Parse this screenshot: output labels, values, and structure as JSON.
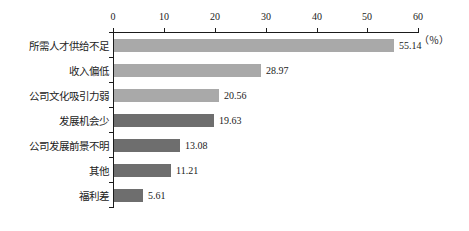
{
  "chart_data": {
    "type": "bar",
    "orientation": "horizontal",
    "title": "",
    "subtitle": "",
    "xlabel": "",
    "ylabel": "",
    "unit_label": "（％）",
    "xlim": [
      0,
      60
    ],
    "xticks": [
      0,
      10,
      20,
      30,
      40,
      50,
      60
    ],
    "xtick_labels": [
      "0",
      "10",
      "20",
      "30",
      "40",
      "50",
      "60"
    ],
    "grid": false,
    "legend": null,
    "categories": [
      "所需人才供给不足",
      "收入偏低",
      "公司文化吸引力弱",
      "发展机会少",
      "公司发展前景不明",
      "其他",
      "福利差"
    ],
    "values": [
      55.14,
      28.97,
      20.56,
      19.63,
      13.08,
      11.21,
      5.61
    ],
    "value_labels": [
      "55.14",
      "28.97",
      "20.56",
      "19.63",
      "13.08",
      "11.21",
      "5.61"
    ],
    "bar_colors": [
      "#a9a9a9",
      "#a9a9a9",
      "#a9a9a9",
      "#6e6e6e",
      "#6e6e6e",
      "#6e6e6e",
      "#6e6e6e"
    ],
    "axis_color": "#1b1b1b",
    "background_color": "#ffffff"
  }
}
